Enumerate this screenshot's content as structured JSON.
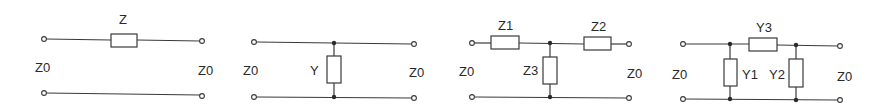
{
  "colors": {
    "line": "#3a3a3a",
    "text": "#2a2a2a",
    "background": "#ffffff"
  },
  "networks": [
    {
      "type": "series-impedance",
      "labels": {
        "element": "Z",
        "port_left": "Z0",
        "port_right": "Z0"
      }
    },
    {
      "type": "shunt-admittance",
      "labels": {
        "element": "Y",
        "port_left": "Z0",
        "port_right": "Z0"
      }
    },
    {
      "type": "T-network",
      "labels": {
        "z1": "Z1",
        "z2": "Z2",
        "z3": "Z3",
        "port_left": "Z0",
        "port_right": "Z0"
      }
    },
    {
      "type": "pi-network",
      "labels": {
        "y1": "Y1",
        "y2": "Y2",
        "y3": "Y3",
        "port_left": "Z0",
        "port_right": "Z0"
      }
    }
  ]
}
